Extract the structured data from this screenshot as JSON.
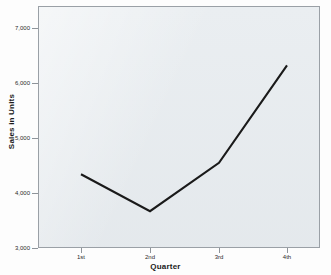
{
  "chart_data": {
    "type": "line",
    "title": "",
    "xlabel": "Quarter",
    "ylabel": "Sales in Units",
    "categories": [
      "1st",
      "2nd",
      "3rd",
      "4th"
    ],
    "values": [
      4340,
      3670,
      4550,
      6320
    ],
    "series": [
      {
        "name": "Sales in Units",
        "values": [
          4340,
          3670,
          4550,
          6320
        ]
      }
    ],
    "ylim": [
      3000,
      7400
    ],
    "xtick_labels": [
      "1st",
      "2nd",
      "3rd",
      "4th"
    ],
    "ytick_labels": [
      "7,000",
      "6,000",
      "5,000",
      "4,000",
      "3,000"
    ],
    "ytick_values": [
      7000,
      6000,
      5000,
      4000,
      3000
    ],
    "grid": false,
    "legend": "none",
    "line_color": "#1a1a1a",
    "plot_background": "#e9edf0",
    "frame_color": "#9aa0a6"
  },
  "axes": {
    "y_title": "Sales in Units",
    "x_title": "Quarter",
    "y_ticks": [
      {
        "label": "7,000",
        "value": 7000
      },
      {
        "label": "6,000",
        "value": 6000
      },
      {
        "label": "5,000",
        "value": 5000
      },
      {
        "label": "4,000",
        "value": 4000
      },
      {
        "label": "3,000",
        "value": 3000
      }
    ],
    "x_ticks": [
      {
        "label": "1st"
      },
      {
        "label": "2nd"
      },
      {
        "label": "3rd"
      },
      {
        "label": "4th"
      }
    ]
  }
}
